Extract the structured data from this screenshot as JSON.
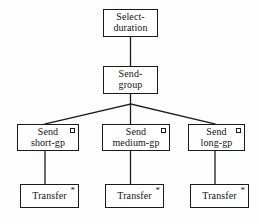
{
  "diagram": {
    "type": "hierarchical-tree",
    "background_color": "#fdfdfd",
    "line_color": "#1a1a1a",
    "text_color": "#111111",
    "nodes": [
      {
        "id": "select-duration",
        "lines": [
          "Select-",
          "duration"
        ],
        "marker": "none",
        "marker_symbol": ""
      },
      {
        "id": "send-group",
        "lines": [
          "Send-",
          "group"
        ],
        "marker": "none",
        "marker_symbol": ""
      },
      {
        "id": "send-short-gp",
        "lines": [
          "Send",
          "short-gp"
        ],
        "marker": "square",
        "marker_symbol": "□"
      },
      {
        "id": "send-medium-gp",
        "lines": [
          "Send",
          "medium-gp"
        ],
        "marker": "square",
        "marker_symbol": "□"
      },
      {
        "id": "send-long-gp",
        "lines": [
          "Send",
          "long-gp"
        ],
        "marker": "square",
        "marker_symbol": "□"
      },
      {
        "id": "transfer-1",
        "lines": [
          "Transfer"
        ],
        "marker": "star",
        "marker_symbol": "*"
      },
      {
        "id": "transfer-2",
        "lines": [
          "Transfer"
        ],
        "marker": "star",
        "marker_symbol": "*"
      },
      {
        "id": "transfer-3",
        "lines": [
          "Transfer"
        ],
        "marker": "star",
        "marker_symbol": "*"
      }
    ],
    "edges": [
      {
        "from": "select-duration",
        "to": "send-group",
        "style": "vertical"
      },
      {
        "from": "send-group",
        "to": "send-short-gp",
        "style": "diagonal"
      },
      {
        "from": "send-group",
        "to": "send-medium-gp",
        "style": "vertical"
      },
      {
        "from": "send-group",
        "to": "send-long-gp",
        "style": "diagonal"
      },
      {
        "from": "send-short-gp",
        "to": "transfer-1",
        "style": "vertical"
      },
      {
        "from": "send-medium-gp",
        "to": "transfer-2",
        "style": "vertical"
      },
      {
        "from": "send-long-gp",
        "to": "transfer-3",
        "style": "vertical"
      }
    ]
  }
}
